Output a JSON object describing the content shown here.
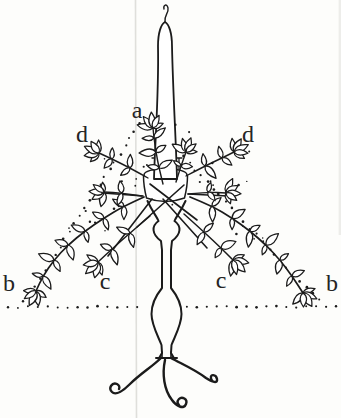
{
  "figure": {
    "kind": "book-illustration-line-drawing",
    "labels": {
      "a": "a",
      "d_left": "d",
      "d_right": "d",
      "b_left": "b",
      "c_left": "c",
      "c_right": "c",
      "b_right": "b"
    },
    "colors": {
      "ink": "#1b1b1b",
      "background": "#fdfdfb",
      "fold_line": "#dedeab",
      "fold_line_gray": "#dfdfdb",
      "edge_shade": "#ededea",
      "leaf_fill": "#ffffff"
    }
  }
}
